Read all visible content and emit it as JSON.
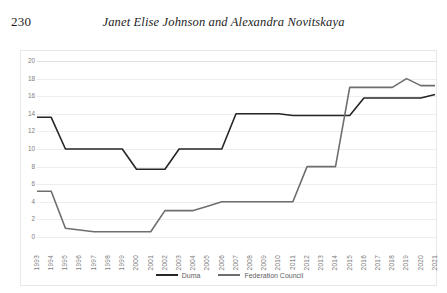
{
  "page": {
    "folio": "230",
    "running_title": "Janet Elise Johnson and Alexandra Novitskaya"
  },
  "chart_data": {
    "type": "line",
    "title": "",
    "xlabel": "",
    "ylabel": "",
    "ylim": [
      0,
      20
    ],
    "ytick_step": 2,
    "yticks": [
      "0",
      "2",
      "4",
      "6",
      "8",
      "10",
      "12",
      "14",
      "16",
      "18",
      "20"
    ],
    "grid": true,
    "legend_position": "bottom",
    "categories": [
      "1993",
      "1994",
      "1995",
      "1996",
      "1997",
      "1998",
      "1999",
      "2000",
      "2001",
      "2002",
      "2003",
      "2004",
      "2005",
      "2006",
      "2007",
      "2008",
      "2009",
      "2010",
      "2011",
      "2012",
      "2013",
      "2014",
      "2015",
      "2016",
      "2017",
      "2018",
      "2019",
      "2020",
      "2021"
    ],
    "series": [
      {
        "name": "Duma",
        "color": "#262626",
        "values": [
          13.6,
          13.6,
          10.0,
          10.0,
          10.0,
          10.0,
          10.0,
          7.7,
          7.7,
          7.7,
          10.0,
          10.0,
          10.0,
          10.0,
          14.0,
          14.0,
          14.0,
          14.0,
          13.8,
          13.8,
          13.8,
          13.8,
          13.8,
          15.8,
          15.8,
          15.8,
          15.8,
          15.8,
          16.2
        ]
      },
      {
        "name": "Federation Council",
        "color": "#6e6e6e",
        "values": [
          5.2,
          5.2,
          1.0,
          0.8,
          0.6,
          0.6,
          0.6,
          0.6,
          0.6,
          3.0,
          3.0,
          3.0,
          3.5,
          4.0,
          4.0,
          4.0,
          4.0,
          4.0,
          4.0,
          8.0,
          8.0,
          8.0,
          17.0,
          17.0,
          17.0,
          17.0,
          18.0,
          17.2,
          17.2
        ]
      }
    ]
  },
  "legend": {
    "items": [
      {
        "label": "Duma",
        "color": "#262626"
      },
      {
        "label": "Federation Council",
        "color": "#6e6e6e"
      }
    ]
  }
}
